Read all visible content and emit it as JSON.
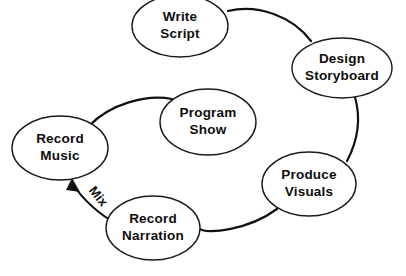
{
  "diagram": {
    "type": "flow-cycle",
    "background_color": "#ffffff",
    "stroke_color": "#111111",
    "text_color": "#0d0d0d",
    "nodes": [
      {
        "id": "write-script",
        "label_line1": "Write",
        "label_line2": "Script",
        "cx": 180,
        "cy": 26,
        "rx": 48,
        "ry": 31
      },
      {
        "id": "design-storyboard",
        "label_line1": "Design",
        "label_line2": "Storyboard",
        "cx": 342,
        "cy": 68,
        "rx": 50,
        "ry": 30
      },
      {
        "id": "produce-visuals",
        "label_line1": "Produce",
        "label_line2": "Visuals",
        "cx": 309,
        "cy": 184,
        "rx": 47,
        "ry": 32
      },
      {
        "id": "record-narration",
        "label_line1": "Record",
        "label_line2": "Narration",
        "cx": 153,
        "cy": 228,
        "rx": 47,
        "ry": 32
      },
      {
        "id": "record-music",
        "label_line1": "Record",
        "label_line2": "Music",
        "cx": 60,
        "cy": 148,
        "rx": 48,
        "ry": 32
      },
      {
        "id": "program-show",
        "label_line1": "Program",
        "label_line2": "Show",
        "cx": 208,
        "cy": 122,
        "rx": 48,
        "ry": 33
      }
    ],
    "edges": [
      {
        "id": "script-to-storyboard",
        "from": "write-script",
        "to": "design-storyboard",
        "label": ""
      },
      {
        "id": "storyboard-to-visuals",
        "from": "design-storyboard",
        "to": "produce-visuals",
        "label": ""
      },
      {
        "id": "visuals-to-narration",
        "from": "produce-visuals",
        "to": "record-narration",
        "label": ""
      },
      {
        "id": "music-to-program",
        "from": "record-music",
        "to": "program-show",
        "label": ""
      }
    ],
    "mix_edge": {
      "id": "mix-arrow",
      "label": "Mix",
      "from": "record-music",
      "to": "record-narration",
      "bidirectional": true,
      "label_rotation_deg": 52
    }
  }
}
